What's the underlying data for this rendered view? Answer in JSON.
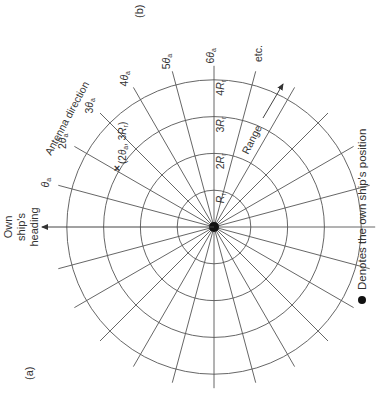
{
  "figure": {
    "panel_a_label": "(a)",
    "panel_b_label": "(b)",
    "heading_label_lines": [
      "Own",
      "ship's",
      "heading"
    ],
    "antenna_direction_label": "Antenna direction",
    "range_label": "Range",
    "etc_label": "etc.",
    "legend_text": "Denotes the own ship's position",
    "point_label": "(2θa, 3Rr)",
    "angle_labels": [
      {
        "mult": "",
        "sym": "θ",
        "sub": "a"
      },
      {
        "mult": "2",
        "sym": "θ",
        "sub": "a"
      },
      {
        "mult": "3",
        "sym": "θ",
        "sub": "a"
      },
      {
        "mult": "4",
        "sym": "θ",
        "sub": "a"
      },
      {
        "mult": "5",
        "sym": "θ",
        "sub": "a"
      },
      {
        "mult": "6",
        "sym": "θ",
        "sub": "a"
      }
    ],
    "range_labels": [
      {
        "mult": "",
        "sym": "R",
        "sub": "r"
      },
      {
        "mult": "2",
        "sym": "R",
        "sub": "r"
      },
      {
        "mult": "3",
        "sym": "R",
        "sub": "r"
      },
      {
        "mult": "4",
        "sym": "R",
        "sub": "r"
      }
    ],
    "grid": {
      "ring_count": 4,
      "spoke_count": 24,
      "spoke_step_deg": 15,
      "rotation_deg": -90,
      "line_color": "#555555",
      "center_color": "#111111"
    }
  }
}
